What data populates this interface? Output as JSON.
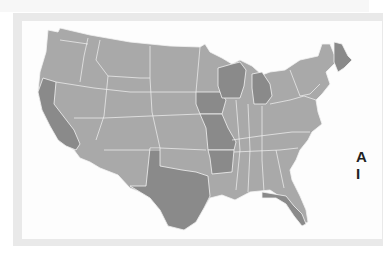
{
  "map": {
    "type": "choropleth",
    "region": "United States",
    "colors": {
      "base": "#a9a9a9",
      "highlight": "#8a8a8a",
      "border": "#f2f2f2",
      "frame": "#e9e9e9",
      "background": "#fdfdfd"
    },
    "highlighted_states": [
      "California",
      "Texas",
      "Iowa",
      "Missouri",
      "Arkansas",
      "Wisconsin",
      "Michigan",
      "Florida",
      "Maine"
    ]
  },
  "edge_text": {
    "line1": "A",
    "line2": "I"
  }
}
